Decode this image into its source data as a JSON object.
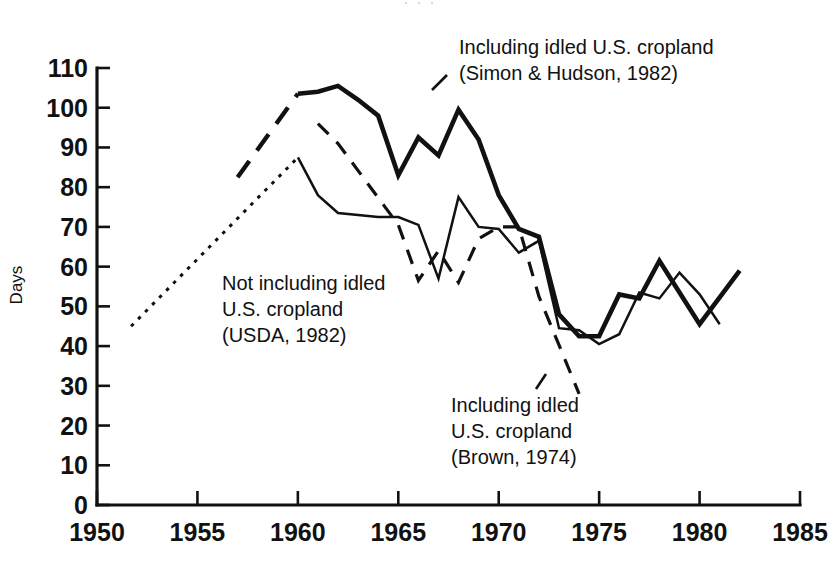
{
  "figure": {
    "cut_off_header": "· · ·",
    "background_color": "#ffffff",
    "ink_color": "#111111"
  },
  "axes": {
    "y_title": "Days",
    "y_ticks": [
      "0",
      "10",
      "20",
      "30",
      "40",
      "50",
      "60",
      "70",
      "80",
      "90",
      "100",
      "110"
    ],
    "x_ticks": [
      "1950",
      "1955",
      "1960",
      "1965",
      "1970",
      "1975",
      "1980",
      "1985"
    ]
  },
  "annotations": {
    "simon_hudson": {
      "line1": "Including idled U.S. cropland",
      "line2": "(Simon & Hudson, 1982)"
    },
    "usda": {
      "line1": "Not including idled",
      "line2": "U.S. cropland",
      "line3": "(USDA, 1982)"
    },
    "brown": {
      "line1": "Including idled",
      "line2": "U.S. cropland",
      "line3": "(Brown, 1974)"
    }
  },
  "chart_data": {
    "type": "line",
    "title": "",
    "xlabel": "",
    "ylabel": "Days",
    "xlim": [
      1950,
      1985
    ],
    "ylim": [
      0,
      110
    ],
    "x_tick_step": 5,
    "y_tick_step": 10,
    "grid": false,
    "legend": "inline annotations",
    "series": [
      {
        "name": "Including idled U.S. cropland (Simon & Hudson, 1982)",
        "style": "solid-bold",
        "note": "heavy solid curve, leading dashed lead-in segment 1957-1960",
        "lead_in_style": "dashed-long",
        "lead_in": [
          {
            "x": 1957.0,
            "y": 82.5
          },
          {
            "x": 1960.0,
            "y": 103.5
          }
        ],
        "points": [
          {
            "x": 1960.0,
            "y": 103.5
          },
          {
            "x": 1961.0,
            "y": 104.0
          },
          {
            "x": 1962.0,
            "y": 105.5
          },
          {
            "x": 1963.0,
            "y": 102.0
          },
          {
            "x": 1964.0,
            "y": 98.0
          },
          {
            "x": 1965.0,
            "y": 83.0
          },
          {
            "x": 1966.0,
            "y": 92.5
          },
          {
            "x": 1967.0,
            "y": 88.0
          },
          {
            "x": 1968.0,
            "y": 99.5
          },
          {
            "x": 1969.0,
            "y": 92.0
          },
          {
            "x": 1970.0,
            "y": 78.0
          },
          {
            "x": 1971.0,
            "y": 69.5
          },
          {
            "x": 1972.0,
            "y": 67.5
          },
          {
            "x": 1973.0,
            "y": 48.0
          },
          {
            "x": 1974.0,
            "y": 42.5
          },
          {
            "x": 1975.0,
            "y": 42.5
          },
          {
            "x": 1976.0,
            "y": 53.0
          },
          {
            "x": 1977.0,
            "y": 52.0
          },
          {
            "x": 1978.0,
            "y": 61.5
          },
          {
            "x": 1979.0,
            "y": 53.5
          },
          {
            "x": 1980.0,
            "y": 45.5
          },
          {
            "x": 1982.0,
            "y": 59.0
          }
        ]
      },
      {
        "name": "Not including idled U.S. cropland (USDA, 1982)",
        "style": "solid-thin",
        "note": "thin solid curve, leading dotted lead-in segment 1952-1960",
        "lead_in_style": "dotted",
        "lead_in": [
          {
            "x": 1951.7,
            "y": 45.0
          },
          {
            "x": 1960.0,
            "y": 87.5
          }
        ],
        "points": [
          {
            "x": 1960.0,
            "y": 87.5
          },
          {
            "x": 1961.0,
            "y": 78.0
          },
          {
            "x": 1962.0,
            "y": 73.5
          },
          {
            "x": 1963.0,
            "y": 73.0
          },
          {
            "x": 1964.0,
            "y": 72.5
          },
          {
            "x": 1965.0,
            "y": 72.5
          },
          {
            "x": 1966.0,
            "y": 70.5
          },
          {
            "x": 1967.0,
            "y": 57.0
          },
          {
            "x": 1968.0,
            "y": 77.5
          },
          {
            "x": 1969.0,
            "y": 70.0
          },
          {
            "x": 1970.0,
            "y": 69.5
          },
          {
            "x": 1971.0,
            "y": 63.5
          },
          {
            "x": 1972.0,
            "y": 66.5
          },
          {
            "x": 1973.0,
            "y": 44.5
          },
          {
            "x": 1974.0,
            "y": 44.0
          },
          {
            "x": 1975.0,
            "y": 40.5
          },
          {
            "x": 1976.0,
            "y": 43.0
          },
          {
            "x": 1977.0,
            "y": 53.5
          },
          {
            "x": 1978.0,
            "y": 52.0
          },
          {
            "x": 1979.0,
            "y": 58.5
          },
          {
            "x": 1980.0,
            "y": 53.0
          },
          {
            "x": 1981.0,
            "y": 45.5
          }
        ]
      },
      {
        "name": "Including idled U.S. cropland (Brown, 1974)",
        "style": "dashed-medium",
        "points": [
          {
            "x": 1961.0,
            "y": 96.0
          },
          {
            "x": 1962.0,
            "y": 91.0
          },
          {
            "x": 1965.0,
            "y": 70.5
          },
          {
            "x": 1966.0,
            "y": 56.5
          },
          {
            "x": 1967.0,
            "y": 64.0
          },
          {
            "x": 1968.0,
            "y": 56.0
          },
          {
            "x": 1969.0,
            "y": 67.0
          },
          {
            "x": 1970.0,
            "y": 70.0
          },
          {
            "x": 1971.0,
            "y": 70.0
          },
          {
            "x": 1972.0,
            "y": 52.5
          },
          {
            "x": 1974.0,
            "y": 28.0
          }
        ]
      }
    ]
  }
}
